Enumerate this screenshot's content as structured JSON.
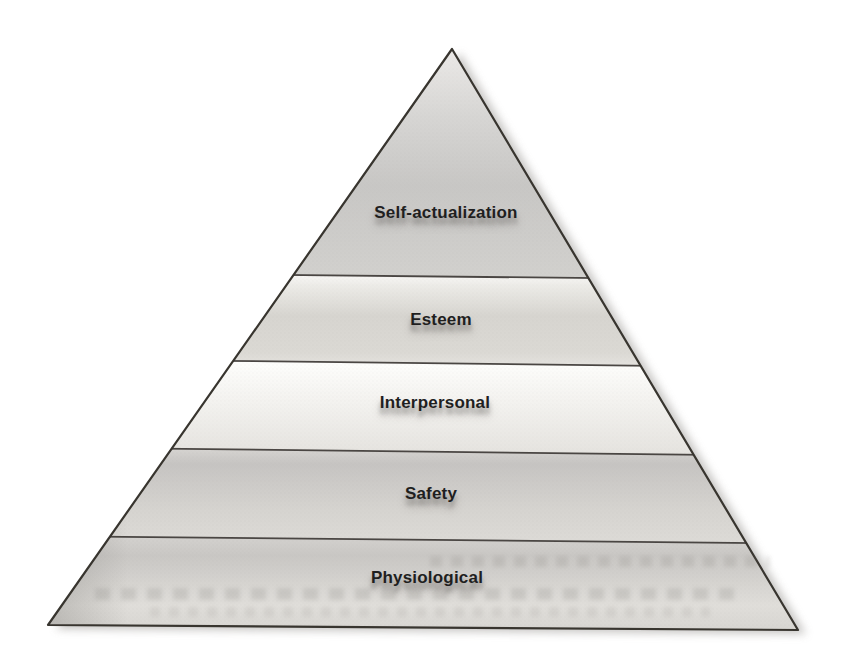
{
  "page": {
    "background_color": "#ffffff",
    "kind": "scanned-book-figure"
  },
  "pyramid": {
    "type": "hierarchy-pyramid",
    "levels": [
      {
        "rank": 1,
        "position": "top",
        "label": "Self-actualization"
      },
      {
        "rank": 2,
        "position": "second",
        "label": "Esteem"
      },
      {
        "rank": 3,
        "position": "middle",
        "label": "Interpersonal"
      },
      {
        "rank": 4,
        "position": "fourth",
        "label": "Safety"
      },
      {
        "rank": 5,
        "position": "bottom",
        "label": "Physiological"
      }
    ],
    "colors": {
      "outline": "#38352f",
      "divider_line": "#4a4643",
      "label_text": "#1f1f1f",
      "band_highlight": "#f8f7f5",
      "band_light": "#f2f1ee",
      "band_mid": "#d6d4cf",
      "band_dark": "#c6c4c2",
      "shadow": "#b0aeab"
    }
  }
}
